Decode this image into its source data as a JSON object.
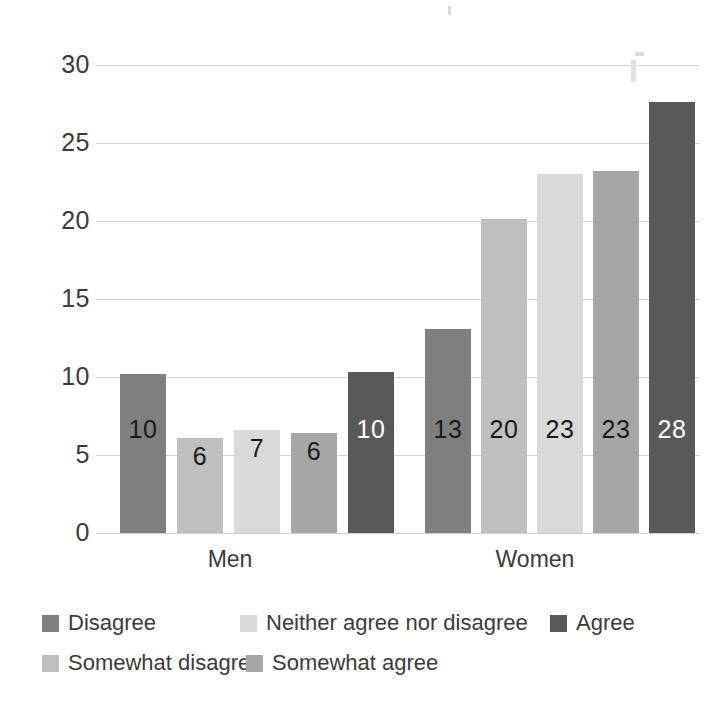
{
  "chart_data": {
    "type": "bar",
    "title": "",
    "subtitle": "",
    "xlabel": "",
    "ylabel": "",
    "categories": [
      "Men",
      "Women"
    ],
    "ylim": [
      0,
      30
    ],
    "yticks": [
      0,
      5,
      10,
      15,
      20,
      25,
      30
    ],
    "ytick_labels": [
      "0",
      "5",
      "10",
      "15",
      "20",
      "25",
      "30"
    ],
    "grid": true,
    "legend_position": "bottom",
    "series": [
      {
        "name": "Disagree",
        "color": "#7f7f7f",
        "values": [
          10.2,
          13.1
        ],
        "labels": [
          "10",
          "13"
        ],
        "label_colors": [
          "#1a1a1a",
          "#1a1a1a"
        ]
      },
      {
        "name": "Somewhat disagree",
        "color": "#bfbfbf",
        "values": [
          6.1,
          20.1
        ],
        "labels": [
          "6",
          "20"
        ],
        "label_colors": [
          "#1a1a1a",
          "#1a1a1a"
        ]
      },
      {
        "name": "Neither agree nor disagree",
        "color": "#d9d9d9",
        "values": [
          6.6,
          23.0
        ],
        "labels": [
          "7",
          "23"
        ],
        "label_colors": [
          "#1a1a1a",
          "#1a1a1a"
        ]
      },
      {
        "name": "Somewhat agree",
        "color": "#a6a6a6",
        "values": [
          6.4,
          23.2
        ],
        "labels": [
          "6",
          "23"
        ],
        "label_colors": [
          "#1a1a1a",
          "#1a1a1a"
        ]
      },
      {
        "name": "Agree",
        "color": "#595959",
        "values": [
          10.3,
          27.6
        ],
        "labels": [
          "10",
          "28"
        ],
        "label_colors": [
          "#ffffff",
          "#ffffff"
        ]
      }
    ]
  },
  "legend": {
    "rows": [
      [
        {
          "label": "Disagree",
          "color": "#7f7f7f"
        },
        {
          "label": "Neither agree nor disagree",
          "color": "#d9d9d9"
        },
        {
          "label": "Agree",
          "color": "#595959"
        }
      ],
      [
        {
          "label": "Somewhat disagree",
          "color": "#bfbfbf"
        },
        {
          "label": "Somewhat agree",
          "color": "#a6a6a6"
        }
      ]
    ]
  }
}
